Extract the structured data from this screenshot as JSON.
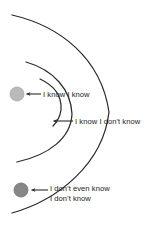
{
  "diagram": {
    "background_color": "#ffffff",
    "stroke_color": "#2b2b2b",
    "text_color": "#1c1c1c",
    "labels": {
      "know_know": "I know I know",
      "know_dont_know": "I know I don't know",
      "dont_even_know_line1": "I don't even know",
      "dont_even_know_line2": "I don't know"
    },
    "markers": [
      {
        "name": "known-knowns-dot",
        "label_key": "know_know",
        "fill": "#b9b9b9",
        "stroke": "#a0a0a0",
        "cx": 17,
        "cy": 94,
        "r": 7
      },
      {
        "name": "unknown-unknowns-dot",
        "label_key": "dont_even_know_line1",
        "fill": "#878787",
        "stroke": "#6f6f6f",
        "cx": 21,
        "cy": 190,
        "r": 7
      }
    ],
    "arcs": [
      {
        "name": "outer-arc",
        "opens": "right",
        "max_x": 110
      },
      {
        "name": "middle-arc",
        "opens": "right",
        "max_x": 72
      },
      {
        "name": "inner-arc",
        "opens": "right",
        "max_x": 62
      }
    ],
    "arrows": [
      {
        "name": "arrow-know-know",
        "from_x": 41,
        "to_x": 25,
        "y": 94
      },
      {
        "name": "arrow-know-dont-know",
        "from_x": 73,
        "to_x": 52,
        "y": 121
      },
      {
        "name": "arrow-dont-even-know",
        "from_x": 48,
        "to_x": 30,
        "y": 190
      }
    ]
  }
}
